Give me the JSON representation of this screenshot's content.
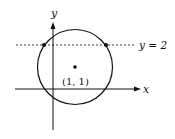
{
  "diagram": {
    "type": "circle-and-line-plot",
    "axes": {
      "x_label": "x",
      "y_label": "y"
    },
    "circle": {
      "center_label": "(1, 1)",
      "center": [
        1,
        1
      ]
    },
    "line": {
      "label": "y = 2",
      "style": "dashed"
    },
    "intersection_points": 2,
    "colors": {
      "stroke": "#111111",
      "background": "#ffffff"
    }
  }
}
